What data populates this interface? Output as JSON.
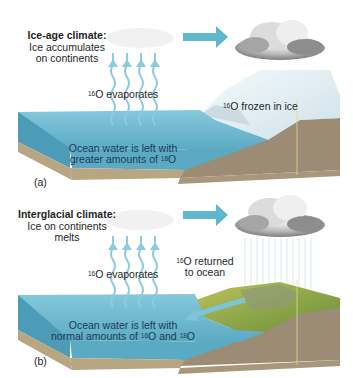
{
  "panels": [
    {
      "id": "a",
      "label": "(a)",
      "title": "Ice-age climate:",
      "subtitle_lines": [
        "Ice accumulates",
        "on continents"
      ],
      "evaporates": {
        "isotope": "16",
        "text": "O evaporates"
      },
      "ice_label": {
        "isotope": "16",
        "text": "O frozen in ice"
      },
      "ocean_lines": [
        "Ocean water is left with",
        "greater amounts of "
      ],
      "ocean_isotope": "18",
      "ocean_suffix": "O"
    },
    {
      "id": "b",
      "label": "(b)",
      "title": "Interglacial climate:",
      "subtitle_lines": [
        "Ice on continents",
        "melts"
      ],
      "evaporates": {
        "isotope": "16",
        "text": "O evaporates"
      },
      "returned_label": {
        "isotope": "16",
        "text_line1": "O returned",
        "text_line2": "to ocean"
      },
      "ocean_lines": [
        "Ocean water is left with",
        "normal amounts of "
      ],
      "ocean_isotope_1": "16",
      "ocean_mid": "O and ",
      "ocean_isotope_2": "18",
      "ocean_suffix": "O"
    }
  ],
  "colors": {
    "ocean_top": "#7ec3d8",
    "ocean_side": "#5aaac4",
    "sediment": "#b8a582",
    "land": "#9c8b75",
    "ice": "#e6f1f5",
    "arrow": "#5fb6cf",
    "vegetation": "#9fb04a"
  }
}
